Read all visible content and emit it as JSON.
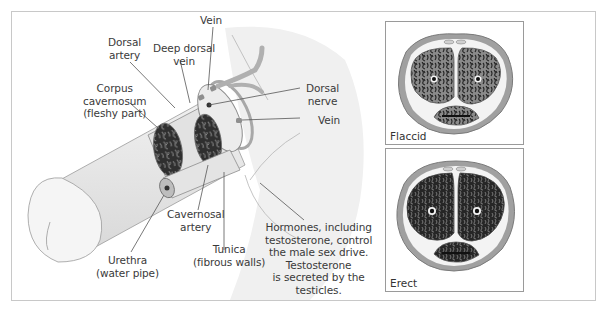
{
  "diagram": {
    "main_illustration": {
      "labels": {
        "vein_top": "Vein",
        "dorsal_artery": [
          "Dorsal",
          "artery"
        ],
        "deep_dorsal_vein": [
          "Deep dorsal",
          "vein"
        ],
        "corpus_cavernosum": [
          "Corpus",
          "cavernosum",
          "(fleshy part)"
        ],
        "dorsal_nerve": [
          "Dorsal",
          "nerve"
        ],
        "vein_side": "Vein",
        "cavernosal_artery": [
          "Cavernosal",
          "artery"
        ],
        "urethra": [
          "Urethra",
          "(water pipe)"
        ],
        "tunica": [
          "Tunica",
          "(fibrous walls)"
        ],
        "hormones_note": [
          "Hormones, including",
          "testosterone, control",
          "the male sex drive.",
          "Testosterone",
          "is secreted by the",
          "testicles."
        ]
      }
    },
    "cross_sections": [
      {
        "state": "Flaccid"
      },
      {
        "state": "Erect"
      }
    ],
    "colors": {
      "outline": "#8c8c8c",
      "shading": "#e6e6e6",
      "tissue_dark": "#2f2f2f",
      "tissue_mid": "#7a7a7a",
      "ring_gray": "#a8a8a8",
      "frame": "#c8c8c8"
    }
  }
}
